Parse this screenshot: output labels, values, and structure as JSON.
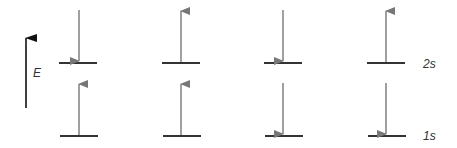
{
  "axis": {
    "label": "E",
    "color": "#111111"
  },
  "levels": {
    "upper": "2s",
    "lower": "1s"
  },
  "configurations": [
    {
      "id": 1,
      "upper_spin": "down",
      "lower_spin": "up"
    },
    {
      "id": 2,
      "upper_spin": "up",
      "lower_spin": "up"
    },
    {
      "id": 3,
      "upper_spin": "down",
      "lower_spin": "down"
    },
    {
      "id": 4,
      "upper_spin": "up",
      "lower_spin": "down"
    }
  ],
  "colors": {
    "level_line": "#333333",
    "spin_arrow": "#777777"
  }
}
